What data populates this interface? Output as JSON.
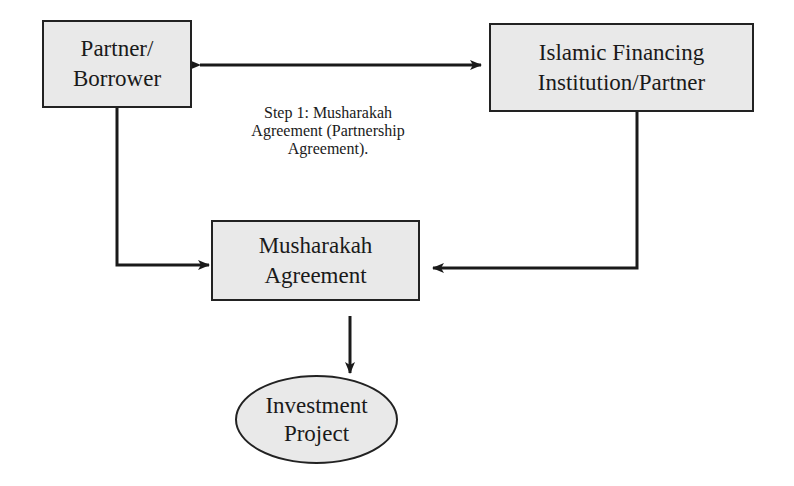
{
  "diagram": {
    "type": "flowchart",
    "nodes": {
      "partner_borrower": {
        "line1": "Partner/",
        "line2": "Borrower"
      },
      "financing_institution": {
        "line1": "Islamic Financing",
        "line2": "Institution/Partner"
      },
      "musharakah_agreement": {
        "line1": "Musharakah",
        "line2": "Agreement"
      },
      "investment_project": {
        "line1": "Investment",
        "line2": "Project"
      }
    },
    "edge_labels": {
      "step1": {
        "line1": "Step 1: Musharakah",
        "line2": "Agreement (Partnership",
        "line3": "Agreement)."
      }
    },
    "edges": [
      {
        "from": "partner_borrower",
        "to": "financing_institution",
        "bidirectional": true,
        "label": "step1"
      },
      {
        "from": "partner_borrower",
        "to": "musharakah_agreement"
      },
      {
        "from": "financing_institution",
        "to": "musharakah_agreement"
      },
      {
        "from": "musharakah_agreement",
        "to": "investment_project"
      }
    ],
    "colors": {
      "node_fill": "#e9e9e9",
      "stroke": "#222222",
      "background": "#ffffff"
    }
  }
}
